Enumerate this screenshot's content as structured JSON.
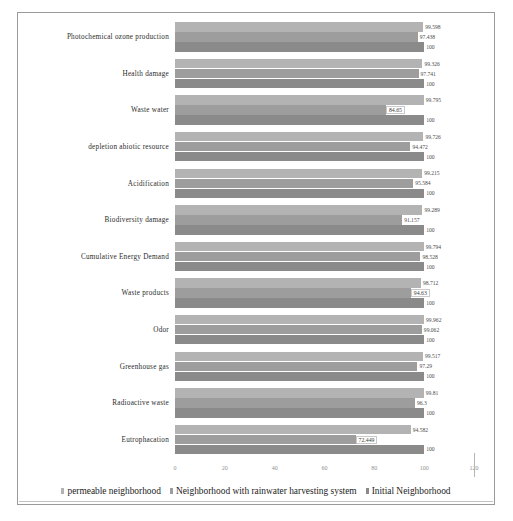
{
  "chart_data": {
    "type": "bar",
    "orientation": "horizontal",
    "title": "",
    "xlabel": "",
    "ylabel": "",
    "xlim": [
      0,
      120
    ],
    "grid": false,
    "legend_position": "bottom",
    "ticks": [
      "0",
      "20",
      "40",
      "60",
      "80",
      "100",
      "120"
    ],
    "categories": [
      "Photochemical ozone production",
      "Health damage",
      "Waste water",
      "depletion abiotic resource",
      "Acidification",
      "Biodiversity damage",
      "Cumulative Energy Demand",
      "Waste products",
      "Odor",
      "Greenhouse gas",
      "Radioactive waste",
      "Eutrophacation"
    ],
    "series": [
      {
        "name": "permeable neighborhood",
        "color": "#b3b3b3",
        "values": [
          99.598,
          99.326,
          99.795,
          99.726,
          99.215,
          99.289,
          99.794,
          98.712,
          99.962,
          99.517,
          99.81,
          94.582
        ]
      },
      {
        "name": "Neighborhood with rainwater harvesting system",
        "color": "#9d9d9d",
        "values": [
          97.438,
          97.741,
          84.65,
          94.472,
          95.584,
          91.157,
          98.528,
          94.63,
          99.062,
          97.29,
          96.3,
          72.449
        ]
      },
      {
        "name": "Initial Neighborhood",
        "color": "#8a8a8a",
        "values": [
          100,
          100,
          100,
          100,
          100,
          100,
          100,
          100,
          100,
          100,
          100,
          100
        ]
      }
    ],
    "value_labels": [
      [
        "99.598",
        "97.438",
        "100"
      ],
      [
        "99.326",
        "97.741",
        "100"
      ],
      [
        "99.795",
        "84.65",
        "100"
      ],
      [
        "99.726",
        "94.472",
        "100"
      ],
      [
        "99.215",
        "95.584",
        "100"
      ],
      [
        "99.289",
        "91.157",
        "100"
      ],
      [
        "99.794",
        "98.528",
        "100"
      ],
      [
        "98.712",
        "94.63",
        "100"
      ],
      [
        "99.962",
        "99.062",
        "100"
      ],
      [
        "99.517",
        "97.29",
        "100"
      ],
      [
        "99.81",
        "96.3",
        "100"
      ],
      [
        "94.582",
        "72.449",
        "100"
      ]
    ],
    "boxed_label_rows": [
      2,
      7,
      11
    ]
  }
}
